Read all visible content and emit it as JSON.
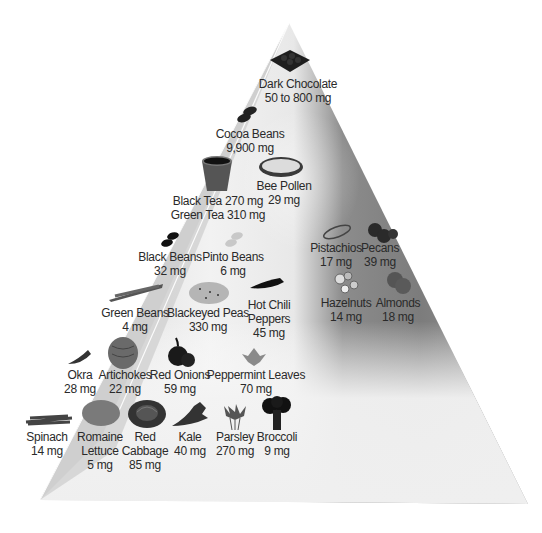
{
  "diagram": {
    "type": "pyramid",
    "colors": {
      "front_face_light": "#f4f4f4",
      "left_face": "#d6d6d6",
      "right_shade_dark": "#7a7a7a",
      "text": "#2a2a2a"
    },
    "items": [
      {
        "id": "dark-chocolate",
        "name": "Dark Chocolate",
        "amount": "50 to 800 mg",
        "icon": "chocolate-bar-icon"
      },
      {
        "id": "cocoa-beans",
        "name": "Cocoa Beans",
        "amount": "9,900 mg",
        "icon": "cocoa-beans-icon"
      },
      {
        "id": "tea",
        "name": "Black Tea 270 mg",
        "amount": "Green Tea 310 mg",
        "icon": "tea-cup-icon"
      },
      {
        "id": "bee-pollen",
        "name": "Bee Pollen",
        "amount": "29 mg",
        "icon": "bee-pollen-bowl-icon"
      },
      {
        "id": "black-beans",
        "name": "Black Beans",
        "amount": "32 mg",
        "icon": "black-beans-icon"
      },
      {
        "id": "pinto-beans",
        "name": "Pinto Beans",
        "amount": "6 mg",
        "icon": "pinto-beans-icon"
      },
      {
        "id": "pistachios",
        "name": "Pistachios",
        "amount": "17 mg",
        "icon": "pistachios-icon"
      },
      {
        "id": "pecans",
        "name": "Pecans",
        "amount": "39 mg",
        "icon": "pecans-icon"
      },
      {
        "id": "hazelnuts",
        "name": "Hazelnuts",
        "amount": "14 mg",
        "icon": "hazelnuts-icon"
      },
      {
        "id": "almonds",
        "name": "Almonds",
        "amount": "18 mg",
        "icon": "almonds-icon"
      },
      {
        "id": "green-beans",
        "name": "Green Beans",
        "amount": "4 mg",
        "icon": "green-beans-icon"
      },
      {
        "id": "blackeyed-peas",
        "name": "Blackeyed Peas",
        "amount": "330 mg",
        "icon": "blackeyed-peas-icon"
      },
      {
        "id": "hot-chili",
        "name": "Hot Chili",
        "name2": "Peppers",
        "amount": "45 mg",
        "icon": "chili-pepper-icon"
      },
      {
        "id": "okra",
        "name": "Okra",
        "amount": "28 mg",
        "icon": "okra-icon"
      },
      {
        "id": "artichokes",
        "name": "Artichokes",
        "amount": "22 mg",
        "icon": "artichoke-icon"
      },
      {
        "id": "red-onions",
        "name": "Red Onions",
        "amount": "59 mg",
        "icon": "red-onion-icon"
      },
      {
        "id": "peppermint",
        "name": "Peppermint Leaves",
        "amount": "70 mg",
        "icon": "peppermint-leaves-icon"
      },
      {
        "id": "spinach",
        "name": "Spinach",
        "amount": "14 mg",
        "icon": "spinach-icon"
      },
      {
        "id": "romaine",
        "name": "Romaine",
        "name2": "Lettuce",
        "amount": "5 mg",
        "icon": "romaine-lettuce-icon"
      },
      {
        "id": "red-cabbage",
        "name": "Red",
        "name2": "Cabbage",
        "amount": "85 mg",
        "icon": "red-cabbage-icon"
      },
      {
        "id": "kale",
        "name": "Kale",
        "amount": "40 mg",
        "icon": "kale-icon"
      },
      {
        "id": "parsley",
        "name": "Parsley",
        "amount": "270 mg",
        "icon": "parsley-icon"
      },
      {
        "id": "broccoli",
        "name": "Broccoli",
        "amount": "9 mg",
        "icon": "broccoli-icon"
      }
    ]
  }
}
